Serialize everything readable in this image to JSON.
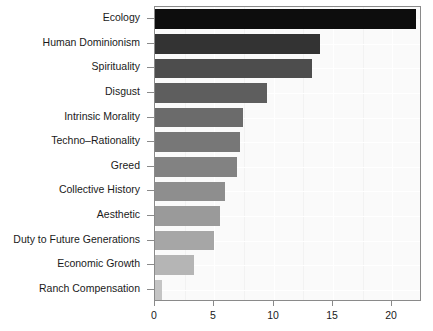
{
  "chart_data": {
    "type": "bar",
    "orientation": "horizontal",
    "title": "",
    "subtitle": "",
    "xlabel": "",
    "ylabel": "",
    "categories": [
      "Ecology",
      "Human Dominionism",
      "Spirituality",
      "Disgust",
      "Intrinsic Morality",
      "Techno–Rationality",
      "Greed",
      "Collective History",
      "Aesthetic",
      "Duty to Future Generations",
      "Economic Growth",
      "Ranch Compensation"
    ],
    "values": [
      22.0,
      13.9,
      13.2,
      9.4,
      7.4,
      7.2,
      6.9,
      5.9,
      5.5,
      5.0,
      3.3,
      0.6
    ],
    "bar_colors": [
      "#0d0d0d",
      "#333333",
      "#4d4d4d",
      "#5e5e5e",
      "#6b6b6b",
      "#777777",
      "#828282",
      "#8e8e8e",
      "#9a9a9a",
      "#a6a6a6",
      "#b5b5b5",
      "#c4c4c4"
    ],
    "xlim": [
      0,
      22.5
    ],
    "xticks": [
      0,
      5,
      10,
      15,
      20
    ],
    "xtick_labels": [
      "0",
      "5",
      "10",
      "15",
      "20"
    ],
    "grid": true,
    "legend": null,
    "plot_background": "#fafafa",
    "frame_color": "#8a8a8a",
    "gridline_color": "#ffffff"
  }
}
